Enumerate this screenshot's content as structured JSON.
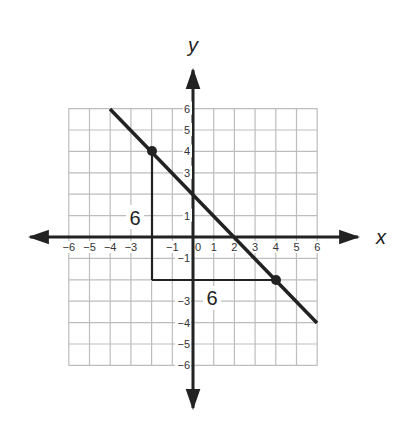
{
  "chart_data": {
    "type": "line",
    "title": "",
    "xlabel": "x",
    "ylabel": "y",
    "xlim": [
      -6,
      6
    ],
    "ylim": [
      -6,
      6
    ],
    "grid": true,
    "x_ticks": [
      "-6",
      "-5",
      "-4",
      "-3",
      "-1",
      "0",
      "1",
      "2",
      "3",
      "4",
      "5",
      "6"
    ],
    "y_ticks": [
      "6",
      "5",
      "4",
      "3",
      "1",
      "-1",
      "-3",
      "-4",
      "-5",
      "-6"
    ],
    "series": [
      {
        "name": "line",
        "x": [
          -4,
          6
        ],
        "y": [
          6,
          -4
        ],
        "slope": -1,
        "y_intercept": 2
      }
    ],
    "points": [
      {
        "label": "A",
        "x": -2,
        "y": 4
      },
      {
        "label": "B",
        "x": 4,
        "y": -2
      }
    ],
    "slope_triangle": {
      "vertices": [
        [
          -2,
          4
        ],
        [
          -2,
          -2
        ],
        [
          4,
          -2
        ]
      ],
      "rise_label": "6",
      "run_label": "6"
    },
    "annotations": [
      {
        "text": "6",
        "x": -2.8,
        "y": 1,
        "role": "rise"
      },
      {
        "text": "6",
        "x": 1,
        "y": -2.9,
        "role": "run"
      }
    ]
  },
  "labels": {
    "x_axis": "x",
    "y_axis": "y",
    "rise": "6",
    "run": "6"
  }
}
